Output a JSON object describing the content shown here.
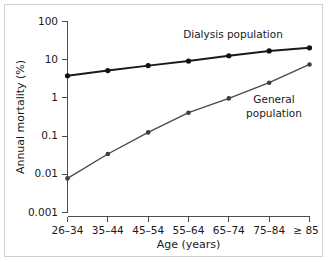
{
  "chart_data": {
    "type": "line",
    "title": "",
    "xlabel": "Age (years)",
    "ylabel": "Annual mortality (%)",
    "categories": [
      "26–34",
      "35–44",
      "45–54",
      "55–64",
      "65–74",
      "75–84",
      "≥ 85"
    ],
    "yscale": "log",
    "ylim": [
      0.001,
      100
    ],
    "ytick_labels": [
      "100",
      "10",
      "1",
      "0.1",
      "0.01",
      "0.001"
    ],
    "ytick_values": [
      100,
      10,
      1,
      0.1,
      0.01,
      0.001
    ],
    "grid": false,
    "legend_position": "inline-annotations",
    "series": [
      {
        "name": "Dialysis population",
        "label": "Dialysis population",
        "color": "#111111",
        "values": [
          3.8,
          5.2,
          7.0,
          9.2,
          12.7,
          17.0,
          20.5
        ]
      },
      {
        "name": "General population",
        "label": "General population",
        "label_line1": "General",
        "label_line2": "population",
        "color": "#3f3f3f",
        "values": [
          0.0078,
          0.034,
          0.125,
          0.41,
          0.97,
          2.5,
          7.5
        ]
      }
    ],
    "annotations": [
      {
        "text": "Dialysis population",
        "target_series": "Dialysis population"
      },
      {
        "text": "General population",
        "target_series": "General population"
      }
    ]
  },
  "figure": {
    "background_color": "#ffffff",
    "border_color": "#cfcfcf",
    "axis_color": "#4d4d4d"
  }
}
